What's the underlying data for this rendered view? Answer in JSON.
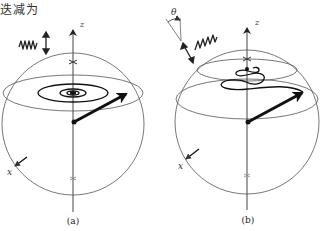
{
  "header": {
    "text": "迭减为"
  },
  "panels": [
    {
      "id": "a",
      "caption": "(a)",
      "axis_z_label": "z",
      "axis_x_label": "x",
      "description": "Spin vector spiralling toward the z-axis in the equatorial plane"
    },
    {
      "id": "b",
      "caption": "(b)",
      "axis_z_label": "z",
      "axis_x_label": "x",
      "angle_label": "θ",
      "description": "Spin vector precessing while tilting upward toward a smaller ring"
    }
  ],
  "colors": {
    "line": "#333333",
    "thick": "#111111",
    "thin": "#555555"
  }
}
